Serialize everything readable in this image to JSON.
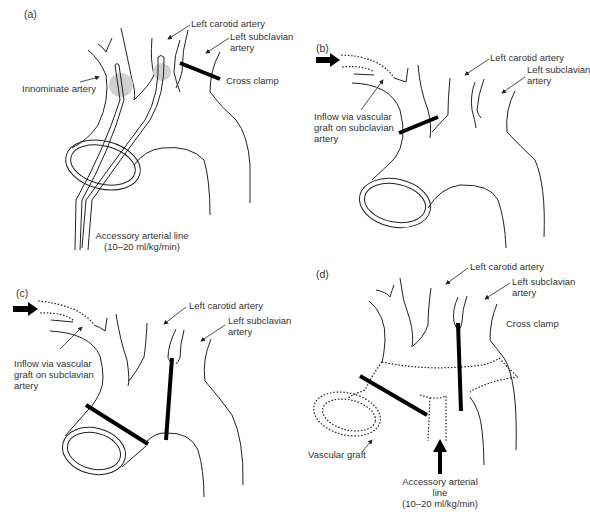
{
  "figure": {
    "panels": [
      {
        "id": "a",
        "label": "(a)",
        "annotations": {
          "left_carotid": "Left carotid artery",
          "left_subclavian_1": "Left subclavian",
          "left_subclavian_2": "artery",
          "innominate": "Innominate artery",
          "cross_clamp": "Cross clamp",
          "accessory_line_1": "Accessory arterial line",
          "accessory_line_2": "(10–20 ml/kg/min)"
        }
      },
      {
        "id": "b",
        "label": "(b)",
        "annotations": {
          "left_carotid": "Left carotid artery",
          "left_subclavian_1": "Left subclavian",
          "left_subclavian_2": "artery",
          "inflow_1": "Inflow via vascular",
          "inflow_2": "graft on subclavian",
          "inflow_3": "artery"
        }
      },
      {
        "id": "c",
        "label": "(c)",
        "annotations": {
          "left_carotid": "Left carotid artery",
          "left_subclavian_1": "Left subclavian",
          "left_subclavian_2": "artery",
          "inflow_1": "Inflow via vascular",
          "inflow_2": "graft on subclavian",
          "inflow_3": "artery"
        }
      },
      {
        "id": "d",
        "label": "(d)",
        "annotations": {
          "left_carotid": "Left carotid artery",
          "left_subclavian_1": "Left subclavian",
          "left_subclavian_2": "artery",
          "cross_clamp": "Cross clamp",
          "vascular_graft": "Vascular graft",
          "accessory_line_1": "Accessory arterial",
          "accessory_line_2": "line",
          "accessory_line_3": "(10–20 ml/kg/min)"
        }
      }
    ],
    "colors": {
      "line": "#222222",
      "clamp": "#000000",
      "perfusion_spot": "#d0d0d0",
      "text": "#333333"
    }
  }
}
